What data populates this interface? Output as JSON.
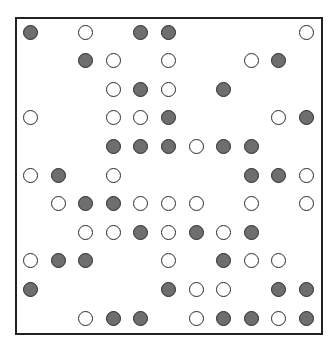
{
  "figure": {
    "columns": 11,
    "rows": 11,
    "colors": {
      "filled": "#6e6e6e",
      "open": "#ffffff",
      "stroke": "#2a2a2a",
      "frame": "#222222"
    },
    "grid": [
      "F.O.FF....O",
      "..FO.O..OF.",
      "...OFO.F...",
      "O..OOF...OF",
      "...FFFOFF..",
      "OF.O....FFO",
      ".OFFOOO.O.O",
      "..OOFOFOF..",
      "OFF..O.FOO.",
      "F....FOO.FF",
      "..OFF.OFFOF"
    ]
  }
}
